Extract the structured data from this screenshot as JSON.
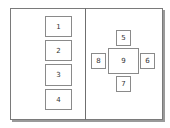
{
  "diagram": {
    "left_panel": {
      "boxes": [
        {
          "label": "1"
        },
        {
          "label": "2"
        },
        {
          "label": "3"
        },
        {
          "label": "4"
        }
      ]
    },
    "right_panel": {
      "center": {
        "label": "9"
      },
      "top": {
        "label": "5"
      },
      "right": {
        "label": "6"
      },
      "bottom": {
        "label": "7"
      },
      "left": {
        "label": "8"
      }
    }
  }
}
